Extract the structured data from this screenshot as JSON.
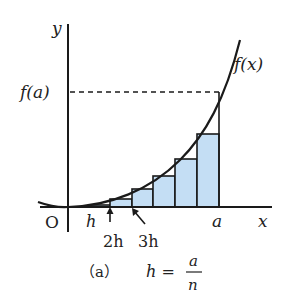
{
  "diagram": {
    "axis_labels": {
      "y": "y",
      "x": "x",
      "origin": "O"
    },
    "curve_label": "f(x)",
    "fa_label": "f(a)",
    "tick_labels": {
      "h": "h",
      "two_h": "2h",
      "three_h": "3h",
      "a": "a"
    },
    "caption": {
      "tag": "（a）",
      "lhs": "h =",
      "num": "a",
      "den": "n"
    },
    "colors": {
      "rect_fill": "#c4def4",
      "stroke": "#1a1a1a"
    },
    "rectangles": [
      {
        "x0": 90,
        "x1": 110,
        "top": 205
      },
      {
        "x0": 110,
        "x1": 132,
        "top": 200
      },
      {
        "x0": 132,
        "x1": 153,
        "top": 189
      },
      {
        "x0": 153,
        "x1": 175,
        "top": 176
      },
      {
        "x0": 175,
        "x1": 197,
        "top": 159
      },
      {
        "x0": 197,
        "x1": 219,
        "top": 134
      }
    ]
  }
}
